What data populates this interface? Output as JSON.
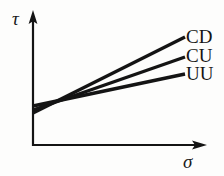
{
  "figure": {
    "background_color": "#fdfdfc",
    "ink_color": "#141414"
  },
  "axes": {
    "y_axis": {
      "name": "tau-axis",
      "label": "τ",
      "label_name": "tau",
      "x": 33,
      "y_top": 12,
      "y_bottom": 146,
      "arrow": "up"
    },
    "x_axis": {
      "name": "sigma-axis",
      "label": "σ",
      "label_name": "sigma",
      "y": 145,
      "x_left": 33,
      "x_right": 206,
      "arrow": "right"
    }
  },
  "chart_data": {
    "type": "line",
    "title": "",
    "xlabel": "σ",
    "ylabel": "τ",
    "grid": false,
    "legend": "inline-right-end-of-line",
    "axis_style": "arrowed-open-axes",
    "tick_labels": {
      "x": [],
      "y": []
    },
    "xlim": [
      0,
      1
    ],
    "ylim": [
      0,
      1
    ],
    "annotation": "Three straight failure envelopes fanning out from a common intersection point; CD has the greatest slope, CU intermediate, UU the least.",
    "intersection_point": {
      "x": 78,
      "y": 99
    },
    "series": [
      {
        "name": "CD",
        "label": "CD",
        "description": "consolidated drained",
        "slope_rank": 1,
        "x": [
          33,
          185
        ],
        "y": [
          113,
          37
        ],
        "stroke": "#141414",
        "width": 3.4
      },
      {
        "name": "CU",
        "label": "CU",
        "description": "consolidated undrained",
        "slope_rank": 2,
        "x": [
          33,
          185
        ],
        "y": [
          110,
          57
        ],
        "stroke": "#141414",
        "width": 3.4
      },
      {
        "name": "UU",
        "label": "UU",
        "description": "unconsolidated undrained",
        "slope_rank": 3,
        "x": [
          33,
          185
        ],
        "y": [
          106,
          74
        ],
        "stroke": "#141414",
        "width": 3.4
      }
    ]
  }
}
